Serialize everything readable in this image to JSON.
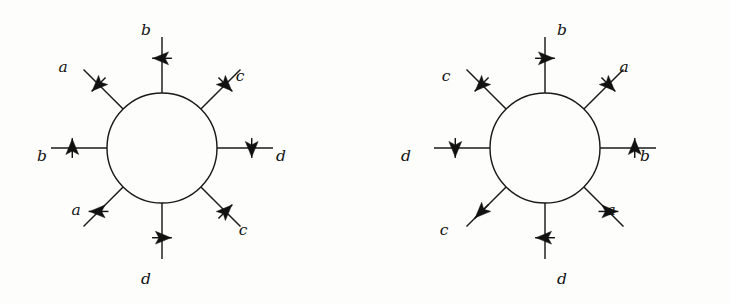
{
  "figure": {
    "title": "",
    "colors": {
      "background": "#fdfdfc",
      "stroke": "#1a1a1a",
      "arrow_fill": "#111111",
      "label": "#111111"
    },
    "diagrams": [
      {
        "id": "left",
        "name": "left-vertex-diagram",
        "center": {
          "x": 162,
          "y": 148
        },
        "radius": 55,
        "legs": [
          {
            "id": "l-top",
            "angle_deg": 90,
            "label": "b",
            "arrow_dir": "left",
            "label_x": 146,
            "label_y": 31
          },
          {
            "id": "l-upleft",
            "angle_deg": 135,
            "label": "a",
            "arrow_dir": "southwest",
            "label_x": 63,
            "label_y": 68
          },
          {
            "id": "l-upright",
            "angle_deg": 45,
            "label": "c",
            "arrow_dir": "southeast",
            "label_x": 240,
            "label_y": 77
          },
          {
            "id": "l-left",
            "angle_deg": 180,
            "label": "b",
            "arrow_dir": "up",
            "label_x": 42,
            "label_y": 157
          },
          {
            "id": "l-right",
            "angle_deg": 0,
            "label": "d",
            "arrow_dir": "down",
            "label_x": 281,
            "label_y": 157
          },
          {
            "id": "l-dnleft",
            "angle_deg": 225,
            "label": "a",
            "arrow_dir": "west",
            "label_x": 76,
            "label_y": 211
          },
          {
            "id": "l-dnright",
            "angle_deg": 315,
            "label": "c",
            "arrow_dir": "northeast",
            "label_x": 243,
            "label_y": 231
          },
          {
            "id": "l-bottom",
            "angle_deg": 270,
            "label": "d",
            "arrow_dir": "right",
            "label_x": 146,
            "label_y": 280
          }
        ]
      },
      {
        "id": "right",
        "name": "right-vertex-diagram",
        "center": {
          "x": 180,
          "y": 148
        },
        "radius": 55,
        "legs": [
          {
            "id": "r-top",
            "angle_deg": 90,
            "label": "b",
            "arrow_dir": "right",
            "label_x": 197,
            "label_y": 31
          },
          {
            "id": "r-upleft",
            "angle_deg": 135,
            "label": "c",
            "arrow_dir": "southwest",
            "label_x": 81,
            "label_y": 77
          },
          {
            "id": "r-upright",
            "angle_deg": 45,
            "label": "a",
            "arrow_dir": "southeast",
            "label_x": 259,
            "label_y": 68
          },
          {
            "id": "r-left",
            "angle_deg": 180,
            "label": "d",
            "arrow_dir": "down",
            "label_x": 41,
            "label_y": 157
          },
          {
            "id": "r-right",
            "angle_deg": 0,
            "label": "b",
            "arrow_dir": "up",
            "label_x": 280,
            "label_y": 157
          },
          {
            "id": "r-dnleft",
            "angle_deg": 225,
            "label": "c",
            "arrow_dir": "southwest",
            "label_x": 79,
            "label_y": 231
          },
          {
            "id": "r-dnright",
            "angle_deg": 315,
            "label": "a",
            "arrow_dir": "east",
            "label_x": 246,
            "label_y": 211
          },
          {
            "id": "r-bottom",
            "angle_deg": 270,
            "label": "d",
            "arrow_dir": "left",
            "label_x": 197,
            "label_y": 280
          }
        ]
      }
    ]
  }
}
